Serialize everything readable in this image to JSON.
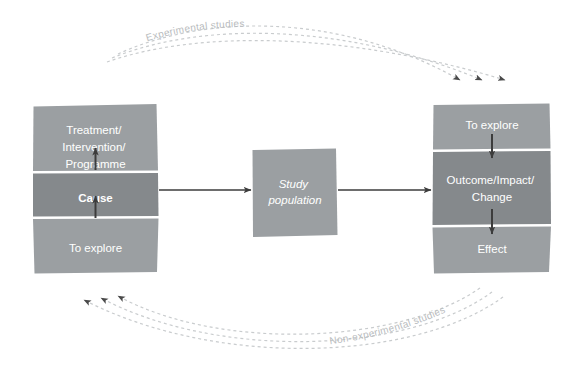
{
  "diagram": {
    "colors": {
      "box_light": "#9b9fa2",
      "box_dark": "#85898c",
      "divider": "#ffffff",
      "arrow_solid": "#3c3c3c",
      "arrow_dashed": "#c9ccce",
      "curve_label": "#b9bcbe",
      "text_on_box": "#ffffff",
      "background": "#ffffff"
    },
    "left_box": {
      "name": "cause-column",
      "bands": [
        {
          "id": "treatment",
          "label": "Treatment/\nIntervention/\nProgramme",
          "lines": [
            "Treatment/",
            "Intervention/",
            "Programme"
          ],
          "emphasis": "normal",
          "shade": "light"
        },
        {
          "id": "cause",
          "label": "Cause",
          "lines": [
            "Cause"
          ],
          "emphasis": "bold",
          "shade": "dark"
        },
        {
          "id": "to-explore-left",
          "label": "To explore",
          "lines": [
            "To explore"
          ],
          "emphasis": "normal",
          "shade": "light"
        }
      ]
    },
    "middle_box": {
      "name": "study-population",
      "lines": [
        "Study",
        "population"
      ],
      "emphasis": "italic",
      "shade": "light"
    },
    "right_box": {
      "name": "effect-column",
      "bands": [
        {
          "id": "to-explore-right",
          "label": "To explore",
          "lines": [
            "To explore"
          ],
          "emphasis": "normal",
          "shade": "light"
        },
        {
          "id": "outcome",
          "label": "Outcome/Impact/\nChange",
          "lines": [
            "Outcome/Impact/",
            "Change"
          ],
          "emphasis": "normal",
          "shade": "dark"
        },
        {
          "id": "effect",
          "label": "Effect",
          "lines": [
            "Effect"
          ],
          "emphasis": "normal",
          "shade": "light"
        }
      ]
    },
    "curve_labels": [
      {
        "id": "experimental",
        "text": "Experimental studies",
        "position": "top"
      },
      {
        "id": "non-experimental",
        "text": "Non-experimental studies",
        "position": "bottom"
      }
    ],
    "flow_arrows": [
      {
        "id": "left-to-middle",
        "from": "cause-column",
        "to": "study-population",
        "style": "solid"
      },
      {
        "id": "middle-to-right",
        "from": "study-population",
        "to": "effect-column",
        "style": "solid"
      }
    ],
    "internal_arrows": [
      {
        "id": "to-explore-to-cause",
        "direction": "up"
      },
      {
        "id": "cause-to-treatment",
        "direction": "up"
      },
      {
        "id": "to-explore-to-outcome",
        "direction": "down"
      },
      {
        "id": "outcome-to-effect",
        "direction": "down"
      }
    ],
    "dashed_arc_count_top": 3,
    "dashed_arc_count_bottom": 3
  }
}
